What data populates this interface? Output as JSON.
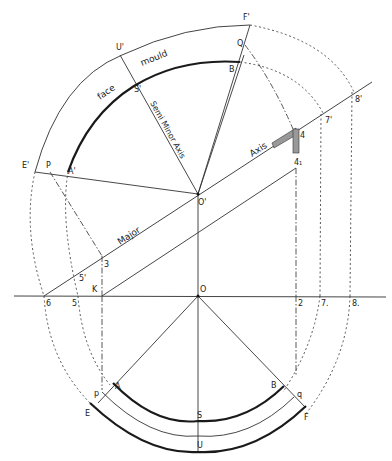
{
  "diagram": {
    "colors": {
      "ink": "#1a1a1a",
      "background": "#ffffff",
      "hatch": "#888888"
    },
    "words": {
      "face": "face",
      "mould": "mould",
      "semi_minor_axis": "Semi Minor Axis",
      "major": "Major",
      "axis": "Axis"
    },
    "points": {
      "F_prime": "F'",
      "Q": "Q",
      "B_upper": "B",
      "U_prime": "U'",
      "S_prime": "S'",
      "E_prime": "E'",
      "P_upper": "P",
      "A_prime": "A'",
      "O_prime": "O'",
      "four": "4",
      "four_sub": "4₁",
      "seven_prime": "7'",
      "eight_prime": "8'",
      "three": "3",
      "five_prime": "5'",
      "K": "K",
      "six": "6",
      "five": "5",
      "O": "O",
      "two": "2",
      "seven": "7.",
      "eight": "8.",
      "p_lower": "p",
      "A_lower": "A",
      "B_lower": "B",
      "q_lower": "q",
      "E": "E",
      "S": "S",
      "F": "F",
      "U": "U"
    }
  }
}
